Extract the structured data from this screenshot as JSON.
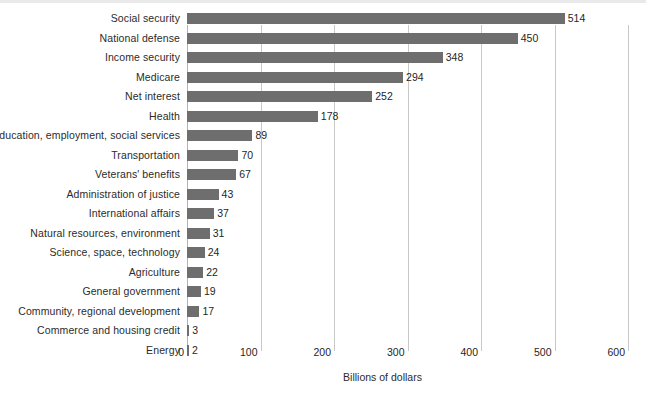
{
  "chart_data": {
    "type": "bar",
    "orientation": "horizontal",
    "title": "",
    "xlabel": "Billions of dollars",
    "ylabel": "",
    "xlim": [
      0,
      600
    ],
    "xticks": [
      0,
      100,
      200,
      300,
      400,
      500,
      600
    ],
    "xtick_labels": [
      "0",
      "100",
      "200",
      "300",
      "400",
      "500",
      "600"
    ],
    "grid": "vertical",
    "legend": "none",
    "bar_color": "#6e6e6e",
    "gridline_color": "#c9c9c9",
    "text_color": "#1f1f1f",
    "background_color": "#ffffff",
    "categories": [
      "Social security",
      "National defense",
      "Income security",
      "Medicare",
      "Net interest",
      "Health",
      "Education, employment, social services",
      "Transportation",
      "Veterans' benefits",
      "Administration of justice",
      "International affairs",
      "Natural resources, environment",
      "Science, space, technology",
      "Agriculture",
      "General government",
      "Community, regional development",
      "Commerce and housing credit",
      "Energy"
    ],
    "values": [
      514,
      450,
      348,
      294,
      252,
      178,
      89,
      70,
      67,
      43,
      37,
      31,
      24,
      22,
      19,
      17,
      3,
      2
    ],
    "value_labels": [
      "514",
      "450",
      "348",
      "294",
      "252",
      "178",
      "89",
      "70",
      "67",
      "43",
      "37",
      "31",
      "24",
      "22",
      "19",
      "17",
      "3",
      "2"
    ]
  }
}
